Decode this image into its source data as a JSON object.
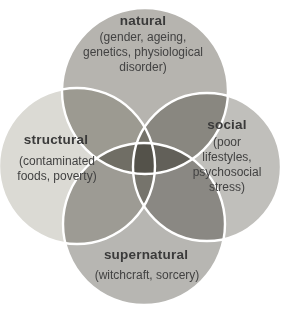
{
  "figure": {
    "type": "venn-diagram",
    "background_color": "#ffffff",
    "ring_color": "#ffffff",
    "label_color": "#3a3a3a",
    "description_color": "#424242",
    "circles": [
      {
        "id": "natural",
        "label": "natural",
        "description": "(gender, ageing, genetics, physiological disorder)",
        "lines": [
          "(gender, ageing,",
          "genetics, physiological",
          "disorder)"
        ],
        "fill": "#b6b4af"
      },
      {
        "id": "structural",
        "label": "structural",
        "description": "(contaminated foods, poverty)",
        "lines": [
          "(contaminated",
          "foods, poverty)"
        ],
        "fill": "#dbdad4"
      },
      {
        "id": "social",
        "label": "social",
        "description": "(poor lifestyles, psychosocial stress)",
        "lines": [
          "(poor",
          "lifestyles,",
          "psychosocial",
          "stress)"
        ],
        "fill": "#c0bfbb"
      },
      {
        "id": "supernatural",
        "label": "supernatural",
        "description": "(witchcraft, sorcery)",
        "lines": [
          "(witchcraft, sorcery)"
        ],
        "fill": "#b7b6b2"
      }
    ]
  }
}
